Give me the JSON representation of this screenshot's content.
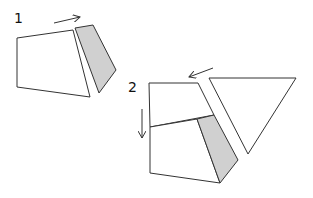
{
  "diagram": {
    "steps": [
      {
        "label": "1",
        "label_pos": [
          14,
          11
        ],
        "arrow": {
          "from": [
            54,
            23
          ],
          "to": [
            80,
            17
          ],
          "direction": "right"
        },
        "shapes": [
          {
            "name": "white-quadrilateral",
            "fill": "#ffffff",
            "points": [
              [
                17,
                38
              ],
              [
                73,
                30
              ],
              [
                90,
                97
              ],
              [
                17,
                87
              ]
            ]
          },
          {
            "name": "grey-quadrilateral",
            "fill": "#d0d0d0",
            "points": [
              [
                75,
                28
              ],
              [
                93,
                25
              ],
              [
                116,
                70
              ],
              [
                99,
                93
              ]
            ]
          }
        ]
      },
      {
        "label": "2",
        "label_pos": [
          128,
          80
        ],
        "arrow_left": {
          "from": [
            213,
            68
          ],
          "to": [
            189,
            77
          ],
          "direction": "left"
        },
        "arrow_down": {
          "from": [
            142,
            109
          ],
          "to": [
            142,
            138
          ],
          "direction": "down"
        },
        "shapes": [
          {
            "name": "top-white-piece",
            "fill": "#ffffff",
            "points": [
              [
                149,
                83
              ],
              [
                198,
                83
              ],
              [
                214,
                115
              ],
              [
                150,
                127
              ]
            ]
          },
          {
            "name": "bottom-white-piece",
            "fill": "#ffffff",
            "points": [
              [
                150,
                127
              ],
              [
                197,
                119
              ],
              [
                220,
                183
              ],
              [
                150,
                173
              ]
            ]
          },
          {
            "name": "grey-piece",
            "fill": "#d0d0d0",
            "points": [
              [
                197,
                119
              ],
              [
                214,
                115
              ],
              [
                238,
                160
              ],
              [
                220,
                183
              ]
            ]
          },
          {
            "name": "white-triangle",
            "fill": "#ffffff",
            "points": [
              [
                209,
                78
              ],
              [
                296,
                78
              ],
              [
                248,
                154
              ]
            ]
          }
        ]
      }
    ],
    "colors": {
      "stroke": "#333333",
      "grey_fill": "#d0d0d0",
      "background": "#ffffff"
    }
  }
}
